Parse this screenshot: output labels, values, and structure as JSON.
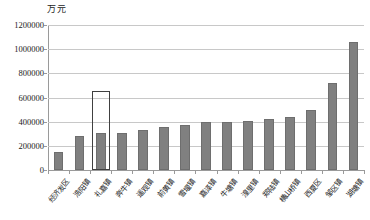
{
  "chart_data": {
    "type": "bar",
    "title": "",
    "xlabel": "",
    "ylabel": "万元",
    "unit_label": "万元",
    "ylim": [
      0,
      1200000
    ],
    "ytick_values": [
      0,
      200000,
      400000,
      600000,
      800000,
      1000000,
      1200000
    ],
    "ytick_labels": [
      "0",
      "200000",
      "400000",
      "600000",
      "800000",
      "1000000",
      "1200000"
    ],
    "grid": true,
    "legend": "none",
    "bar_color": "#808080",
    "highlight_color": "#404040",
    "highlight_index": 2,
    "highlight_value": 650000,
    "categories": [
      "经济发区",
      "浩阳镇",
      "礼嘉镇",
      "奔牛镇",
      "遥观镇",
      "前黄镇",
      "雪堰镇",
      "嘉泽镇",
      "牛塘镇",
      "湟里镇",
      "郑陆镇",
      "横山桥镇",
      "西夏区",
      "邹区镇",
      "湖塘镇"
    ],
    "values": [
      150000,
      280000,
      305000,
      305000,
      335000,
      355000,
      375000,
      395000,
      400000,
      405000,
      425000,
      435000,
      500000,
      720000,
      1060000
    ]
  }
}
